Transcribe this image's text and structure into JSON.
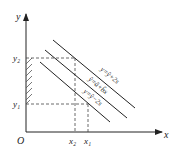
{
  "axes": {
    "x_label": "x",
    "y_label": "y",
    "origin": "O"
  },
  "ticks": {
    "y2": "y₂",
    "y1": "y₁",
    "x2": "x₂",
    "x1": "x₁"
  },
  "lines": {
    "upper": "y=ŷ+2s",
    "middle": "ŷ=â+b̂x",
    "lower": "y=ŷ−2s"
  },
  "colors": {
    "stroke": "#222222",
    "background": "#ffffff"
  }
}
